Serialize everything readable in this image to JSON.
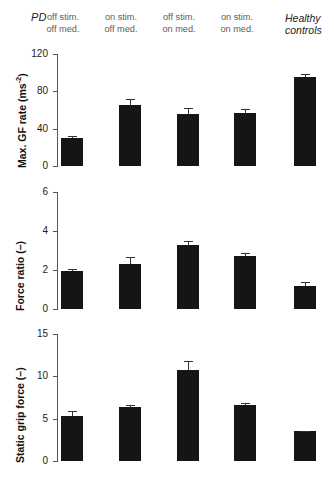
{
  "figure": {
    "groups": {
      "pd_label": "PD",
      "healthy_label": "Healthy controls",
      "healthy_label_line1": "Healthy",
      "healthy_label_line2": "controls"
    },
    "column_headers": [
      {
        "line1": "off stim.",
        "line2": "off med."
      },
      {
        "line1": "on stim.",
        "line2": "off med."
      },
      {
        "line1": "off stim.",
        "line2": "on med."
      },
      {
        "line1": "on stim.",
        "line2": "on med."
      }
    ],
    "colors": {
      "bar": "#151515",
      "axis": "#555555",
      "frame": "#4a4a4a",
      "header_text": "#5d5d5d",
      "background": "#ffffff"
    }
  },
  "chart_data": [
    {
      "type": "bar",
      "title": "",
      "panel": "top",
      "ylabel": "Max. GF rate (ms⁻²)",
      "ylabel_text": "Max. GF rate (ms",
      "ylabel_sup": "-2",
      "ylabel_tail": ")",
      "xlabel": "",
      "ylim": [
        0,
        120
      ],
      "yticks": [
        0,
        40,
        80,
        120
      ],
      "ytick_labels": [
        "0",
        "40",
        "80",
        "120"
      ],
      "grid": false,
      "legend": "none",
      "categories": [
        "off stim. / off med.",
        "on stim. / off med.",
        "off stim. / on med.",
        "on stim. / on med.",
        "Healthy controls"
      ],
      "values": [
        30,
        65,
        56,
        57,
        95
      ],
      "errors": [
        2.5,
        6.5,
        6.0,
        4.0,
        4.0
      ]
    },
    {
      "type": "bar",
      "title": "",
      "panel": "middle",
      "ylabel": "Force ratio (–)",
      "ylabel_text": "Force ratio (–)",
      "ylabel_sup": "",
      "ylabel_tail": "",
      "xlabel": "",
      "ylim": [
        0,
        6
      ],
      "yticks": [
        0,
        2,
        4,
        6
      ],
      "ytick_labels": [
        "0",
        "2",
        "4",
        "6"
      ],
      "grid": false,
      "legend": "none",
      "categories": [
        "off stim. / off med.",
        "on stim. / off med.",
        "off stim. / on med.",
        "on stim. / on med.",
        "Healthy controls"
      ],
      "values": [
        1.95,
        2.3,
        3.3,
        2.7,
        1.2
      ],
      "errors": [
        0.1,
        0.35,
        0.2,
        0.15,
        0.2
      ]
    },
    {
      "type": "bar",
      "title": "",
      "panel": "bottom",
      "ylabel": "Static grip force (–)",
      "ylabel_text": "Static grip force (–)",
      "ylabel_sup": "",
      "ylabel_tail": "",
      "xlabel": "",
      "ylim": [
        0,
        15
      ],
      "yticks": [
        0,
        5,
        10,
        15
      ],
      "ytick_labels": [
        "0",
        "5",
        "10",
        "15"
      ],
      "grid": false,
      "legend": "none",
      "categories": [
        "off stim. / off med.",
        "on stim. / off med.",
        "off stim. / on med.",
        "on stim. / on med.",
        "Healthy controls"
      ],
      "values": [
        5.3,
        6.4,
        10.8,
        6.6,
        3.5
      ],
      "errors": [
        0.6,
        0.25,
        1.0,
        0.2,
        0.1
      ]
    }
  ]
}
